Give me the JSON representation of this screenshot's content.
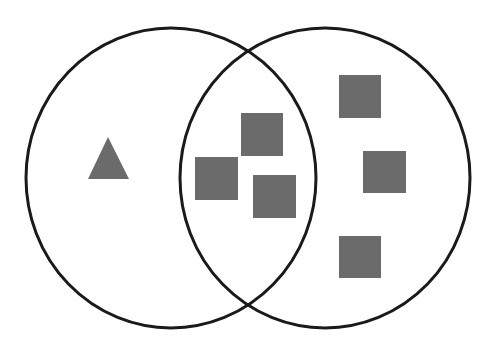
{
  "diagram": {
    "type": "venn",
    "width": 489,
    "height": 344,
    "colors": {
      "background": "#ffffff",
      "stroke": "#1a1a1a",
      "shape_fill": "#6b6b6b"
    },
    "sets": [
      {
        "name": "left-set",
        "cx": 171,
        "cy": 178,
        "rx": 145,
        "ry": 150
      },
      {
        "name": "right-set",
        "cx": 325,
        "cy": 178,
        "rx": 145,
        "ry": 150
      }
    ],
    "triangles": [
      {
        "region": "left-only",
        "points": "108,137 88,179 129,179"
      }
    ],
    "squares": [
      {
        "region": "intersection",
        "x": 241,
        "y": 113,
        "w": 42,
        "h": 43
      },
      {
        "region": "intersection",
        "x": 195,
        "y": 157,
        "w": 43,
        "h": 43
      },
      {
        "region": "intersection",
        "x": 253,
        "y": 175,
        "w": 43,
        "h": 43
      },
      {
        "region": "right-only",
        "x": 339,
        "y": 75,
        "w": 42,
        "h": 43
      },
      {
        "region": "right-only",
        "x": 363,
        "y": 151,
        "w": 43,
        "h": 42
      },
      {
        "region": "right-only",
        "x": 339,
        "y": 236,
        "w": 42,
        "h": 42
      }
    ],
    "counts": {
      "left_only": 1,
      "intersection": 3,
      "right_only": 3
    }
  }
}
